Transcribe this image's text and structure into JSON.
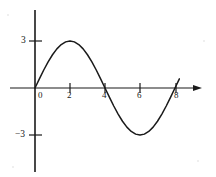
{
  "figure": {
    "title": "",
    "background_color": "#ffffff",
    "stroke_color": "#1a1a1a",
    "width": 216,
    "height": 177
  },
  "axes": {
    "x_axis_name": "x-axis",
    "y_axis_name": "y-axis",
    "origin_label": "0",
    "x_ticks": [
      {
        "label": "2",
        "value": 2
      },
      {
        "label": "4",
        "value": 4
      },
      {
        "label": "6",
        "value": 6
      },
      {
        "label": "8",
        "value": 8
      }
    ],
    "y_ticks": [
      {
        "label": "3",
        "value": 3
      },
      {
        "label": "−3",
        "value": -3
      }
    ]
  },
  "chart_data": {
    "type": "line",
    "title": "",
    "subtitle": "",
    "xlabel": "",
    "ylabel": "",
    "xlim": [
      -1.4,
      9.1
    ],
    "ylim": [
      -5.0,
      5.0
    ],
    "grid": false,
    "legend": null,
    "axis_arrows": {
      "x_right": true,
      "x_left": false,
      "y_top": false,
      "y_bottom": false
    },
    "series": [
      {
        "name": "y = 3 sin(pi x / 4)",
        "color": "#1a1a1a",
        "x": [
          0,
          0.25,
          0.5,
          0.75,
          1,
          1.25,
          1.5,
          1.75,
          2,
          2.25,
          2.5,
          2.75,
          3,
          3.25,
          3.5,
          3.75,
          4,
          4.25,
          4.5,
          4.75,
          5,
          5.25,
          5.5,
          5.75,
          6,
          6.25,
          6.5,
          6.75,
          7,
          7.25,
          7.5,
          7.75,
          8,
          8.25
        ],
        "y": [
          0,
          0.586,
          1.148,
          1.665,
          2.121,
          2.499,
          2.772,
          2.943,
          3.0,
          2.943,
          2.772,
          2.499,
          2.121,
          1.665,
          1.148,
          0.586,
          0,
          -0.586,
          -1.148,
          -1.665,
          -2.121,
          -2.499,
          -2.772,
          -2.943,
          -3.0,
          -2.943,
          -2.772,
          -2.499,
          -2.121,
          -1.665,
          -1.148,
          -0.586,
          0,
          0.586
        ]
      }
    ],
    "key_points": {
      "maximum": {
        "x": 2,
        "y": 3
      },
      "minimum": {
        "x": 6,
        "y": -3
      },
      "zeros": [
        0,
        4,
        8
      ],
      "amplitude": 3,
      "period": 8
    }
  }
}
